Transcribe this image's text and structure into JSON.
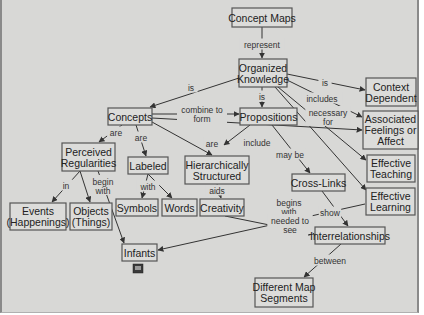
{
  "diagram": {
    "title": "Concept Maps",
    "background": "#d8d8d6",
    "node_border": "#555555",
    "nodes": [
      {
        "id": "concept_maps",
        "lines": [
          "Concept Maps"
        ],
        "x": 232,
        "y": 8,
        "w": 60,
        "h": 19
      },
      {
        "id": "organized_knowledge",
        "lines": [
          "Organized",
          "Knowledge"
        ],
        "x": 239,
        "y": 59,
        "w": 48,
        "h": 28
      },
      {
        "id": "context_dependent",
        "lines": [
          "Context",
          "Dependent"
        ],
        "x": 366,
        "y": 78,
        "w": 50,
        "h": 28
      },
      {
        "id": "concepts",
        "lines": [
          "Concepts"
        ],
        "x": 108,
        "y": 108,
        "w": 44,
        "h": 17
      },
      {
        "id": "propositions",
        "lines": [
          "Propositions"
        ],
        "x": 240,
        "y": 108,
        "w": 57,
        "h": 17
      },
      {
        "id": "associated_feelings",
        "lines": [
          "Associated",
          "Feelings or",
          "Affect"
        ],
        "x": 363,
        "y": 111,
        "w": 55,
        "h": 38
      },
      {
        "id": "perceived_regularities",
        "lines": [
          "Perceived",
          "Regularities"
        ],
        "x": 62,
        "y": 143,
        "w": 53,
        "h": 28
      },
      {
        "id": "labeled",
        "lines": [
          "Labeled"
        ],
        "x": 128,
        "y": 157,
        "w": 40,
        "h": 17
      },
      {
        "id": "hierarchically_structured",
        "lines": [
          "Hierarchically",
          "Structured"
        ],
        "x": 185,
        "y": 156,
        "w": 64,
        "h": 28
      },
      {
        "id": "effective_teaching",
        "lines": [
          "Effective",
          "Teaching"
        ],
        "x": 367,
        "y": 155,
        "w": 48,
        "h": 27
      },
      {
        "id": "cross_links",
        "lines": [
          "Cross-Links"
        ],
        "x": 292,
        "y": 174,
        "w": 53,
        "h": 17
      },
      {
        "id": "effective_learning",
        "lines": [
          "Effective",
          "Learning"
        ],
        "x": 366,
        "y": 188,
        "w": 49,
        "h": 27
      },
      {
        "id": "events",
        "lines": [
          "Events",
          "(Happenings)"
        ],
        "x": 10,
        "y": 203,
        "w": 56,
        "h": 27
      },
      {
        "id": "objects",
        "lines": [
          "Objects",
          "(Things)"
        ],
        "x": 70,
        "y": 203,
        "w": 42,
        "h": 27
      },
      {
        "id": "symbols",
        "lines": [
          "Symbols"
        ],
        "x": 116,
        "y": 199,
        "w": 42,
        "h": 17
      },
      {
        "id": "words",
        "lines": [
          "Words"
        ],
        "x": 162,
        "y": 199,
        "w": 35,
        "h": 17
      },
      {
        "id": "creativity",
        "lines": [
          "Creativity"
        ],
        "x": 200,
        "y": 199,
        "w": 44,
        "h": 17
      },
      {
        "id": "interrelationships",
        "lines": [
          "Interrelationships"
        ],
        "x": 315,
        "y": 227,
        "w": 70,
        "h": 17
      },
      {
        "id": "infants",
        "lines": [
          "Infants"
        ],
        "x": 122,
        "y": 244,
        "w": 35,
        "h": 17
      },
      {
        "id": "different_map_segments",
        "lines": [
          "Different Map",
          "Segments"
        ],
        "x": 255,
        "y": 278,
        "w": 58,
        "h": 29
      }
    ],
    "edges": [
      {
        "from": "concept_maps",
        "to": "organized_knowledge",
        "label": "represent",
        "lx": 262,
        "ly": 45,
        "path": "M262,27 L262,58"
      },
      {
        "from": "organized_knowledge",
        "to": "concepts",
        "label": "is",
        "lx": 191,
        "ly": 88,
        "path": "M239,78 L150,107"
      },
      {
        "from": "organized_knowledge",
        "to": "context_dependent",
        "label": "is",
        "lx": 325,
        "ly": 83,
        "path": "M287,74 L365,90"
      },
      {
        "from": "organized_knowledge",
        "to": "propositions",
        "label": "is",
        "lx": 262,
        "ly": 97,
        "path": "M262,87 L262,107"
      },
      {
        "from": "organized_knowledge",
        "to": "associated_feelings",
        "label": "includes",
        "lx": 322,
        "ly": 99,
        "path": "M287,80 L362,117"
      },
      {
        "from": "organized_knowledge",
        "to": "effective_teaching",
        "label": "necessary for",
        "lx": 328,
        "ly": 117,
        "path": "M278,87 L366,160"
      },
      {
        "from": "organized_knowledge",
        "to": "effective_learning",
        "label": "",
        "lx": 0,
        "ly": 0,
        "path": "M275,87 L366,190"
      },
      {
        "from": "concepts",
        "to": "propositions",
        "label": "combine to form",
        "lx": 202,
        "ly": 114,
        "path": "M152,114 L239,114"
      },
      {
        "from": "concepts",
        "to": "associated_feelings",
        "label": "include",
        "lx": 257,
        "ly": 143,
        "path": "M152,118 L362,130"
      },
      {
        "from": "concepts",
        "to": "hierarchically_structured",
        "label": "are",
        "lx": 212,
        "ly": 144,
        "path": "M152,122 L212,155"
      },
      {
        "from": "propositions",
        "to": "hierarchically_structured",
        "label": "",
        "lx": 0,
        "ly": 0,
        "path": "M250,125 L224,145"
      },
      {
        "from": "concepts",
        "to": "perceived_regularities",
        "label": "are",
        "lx": 116,
        "ly": 133,
        "path": "M122,125 L99,142"
      },
      {
        "from": "concepts",
        "to": "labeled",
        "label": "are",
        "lx": 141,
        "ly": 138,
        "path": "M136,125 L146,156"
      },
      {
        "from": "propositions",
        "to": "cross_links",
        "label": "may be",
        "lx": 290,
        "ly": 155,
        "path": "M272,125 L310,173"
      },
      {
        "from": "perceived_regularities",
        "to": "events",
        "label": "in",
        "lx": 66,
        "ly": 186,
        "path": "M80,171 L52,202"
      },
      {
        "from": "perceived_regularities",
        "to": "objects",
        "label": "",
        "lx": 0,
        "ly": 0,
        "path": "M80,171 L90,202"
      },
      {
        "from": "perceived_regularities",
        "to": "infants",
        "label": "begin with",
        "lx": 103,
        "ly": 186,
        "path": "M98,171 L124,243"
      },
      {
        "from": "labeled",
        "to": "symbols",
        "label": "with",
        "lx": 148,
        "ly": 187,
        "path": "M148,174 L142,198"
      },
      {
        "from": "labeled",
        "to": "words",
        "label": "",
        "lx": 0,
        "ly": 0,
        "path": "M148,174 L172,198"
      },
      {
        "from": "hierarchically_structured",
        "to": "creativity",
        "label": "aids",
        "lx": 217,
        "ly": 191,
        "path": "M217,184 L221,198"
      },
      {
        "from": "cross_links",
        "to": "interrelationships",
        "label": "show",
        "lx": 330,
        "ly": 213,
        "path": "M322,191 L348,226"
      },
      {
        "from": "effective_learning",
        "to": "infants",
        "label": "begins with",
        "lx": 289,
        "ly": 207,
        "path": "M365,204 L158,250"
      },
      {
        "from": "creativity",
        "to": "interrelationships",
        "label": "needed to see",
        "lx": 290,
        "ly": 225,
        "path": "M225,216 L314,234"
      },
      {
        "from": "interrelationships",
        "to": "different_map_segments",
        "label": "between",
        "lx": 330,
        "ly": 261,
        "path": "M341,244 L304,277"
      }
    ],
    "infants_icon": "small-document-icon"
  }
}
